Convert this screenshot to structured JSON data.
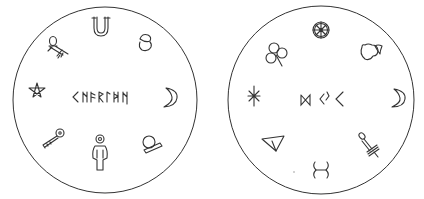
{
  "discs": [
    {
      "id": "left",
      "center_runes": "<NFRIMN",
      "symbols": [
        "ankh",
        "horseshoe",
        "acorn",
        "crescent-moon",
        "crystal-ball",
        "ankh-figure",
        "key",
        "pentagram"
      ]
    },
    {
      "id": "right",
      "center_runes": "⋈ <ᛇ <",
      "symbols": [
        "wheel",
        "apple",
        "crescent-moon",
        "dagger",
        "rune-figure",
        "triangle",
        "asterisk-star",
        "clover"
      ]
    }
  ],
  "colors": {
    "stroke": "#333333",
    "background": "#ffffff"
  }
}
